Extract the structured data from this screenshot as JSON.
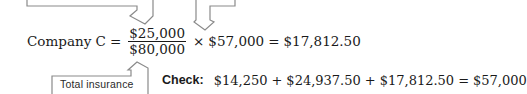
{
  "equation": {
    "lhs": "Company C",
    "equals": "=",
    "fraction": {
      "numerator": "$25,000",
      "denominator": "$80,000"
    },
    "times": "×",
    "multiplier": "$57,000",
    "equals2": "=",
    "result": "$17,812.50"
  },
  "callout": {
    "label": "Total insurance"
  },
  "check": {
    "label": "Check:",
    "term1": "$14,250",
    "plus1": "+",
    "term2": "$24,937.50",
    "plus2": "+",
    "term3": "$17,812.50",
    "equals": "=",
    "total": "$57,000"
  },
  "colors": {
    "line": "#8a8a8a",
    "text": "#1a1a1a"
  }
}
